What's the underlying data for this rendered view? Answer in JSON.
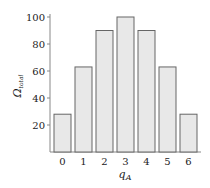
{
  "chart_data": {
    "type": "bar",
    "title": "",
    "xlabel": "q",
    "xlabel_subscript": "A",
    "ylabel": "Ω",
    "ylabel_subscript": "total",
    "categories": [
      "0",
      "1",
      "2",
      "3",
      "4",
      "5",
      "6"
    ],
    "values": [
      28,
      63,
      90,
      100,
      90,
      63,
      28
    ],
    "ylim": [
      0,
      100
    ],
    "yticks": [
      20,
      40,
      60,
      80,
      100
    ],
    "ytick_labels": [
      "20",
      "40",
      "60",
      "80",
      "100"
    ],
    "grid": false,
    "legend": "none",
    "colors": {
      "bar_fill": "#e8e8e8",
      "bar_stroke": "#666666",
      "axis": "#888888"
    }
  }
}
